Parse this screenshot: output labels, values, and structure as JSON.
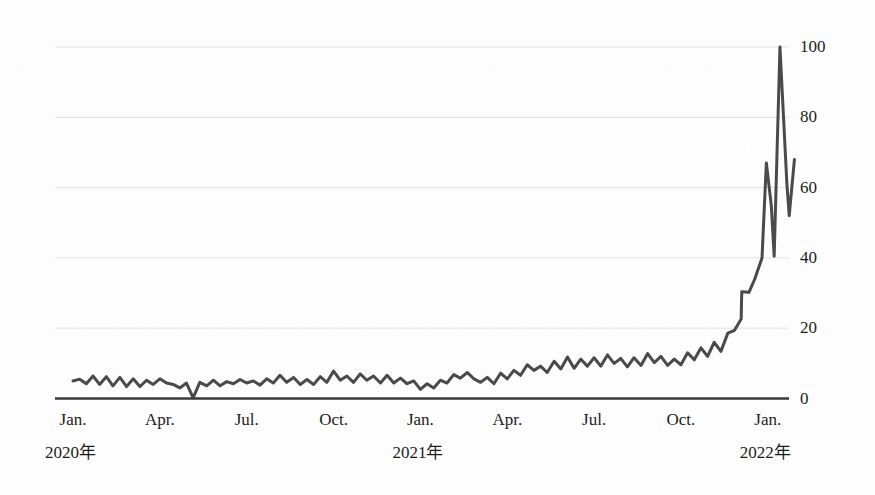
{
  "chart_data": {
    "type": "line",
    "title": "",
    "subtitle": "",
    "xlabel": "",
    "ylabel": "",
    "ylim": [
      0,
      108
    ],
    "yticks": [
      0,
      20,
      40,
      60,
      80,
      100
    ],
    "ytick_labels": [
      "0",
      "20",
      "40",
      "60",
      "80",
      "100"
    ],
    "grid": true,
    "grid_axis": "y",
    "legend": "none",
    "line_color": "#4a4a4a",
    "background_color": "#fdfdfd",
    "axis_color": "#3a3a3a",
    "grid_color": "#e2e2e2",
    "x_axis_type": "weekly-time-series",
    "x_start": "2020-01",
    "x_end": "2022-01",
    "xtick_labels": [
      {
        "label": "Jan.",
        "year": "2020年",
        "month_index": 0
      },
      {
        "label": "Apr.",
        "year": "",
        "month_index": 3
      },
      {
        "label": "Jul.",
        "year": "",
        "month_index": 6
      },
      {
        "label": "Oct.",
        "year": "",
        "month_index": 9
      },
      {
        "label": "Jan.",
        "year": "2021年",
        "month_index": 12
      },
      {
        "label": "Apr.",
        "year": "",
        "month_index": 15
      },
      {
        "label": "Jul.",
        "year": "",
        "month_index": 18
      },
      {
        "label": "Oct.",
        "year": "",
        "month_index": 21
      },
      {
        "label": "Jan.",
        "year": "2022年",
        "month_index": 24
      }
    ],
    "x": [
      0.0,
      0.23,
      0.46,
      0.69,
      0.92,
      1.15,
      1.38,
      1.62,
      1.85,
      2.08,
      2.31,
      2.54,
      2.77,
      3.0,
      3.23,
      3.46,
      3.69,
      3.92,
      4.15,
      4.38,
      4.62,
      4.85,
      5.08,
      5.31,
      5.54,
      5.77,
      6.0,
      6.23,
      6.46,
      6.69,
      6.92,
      7.15,
      7.38,
      7.62,
      7.85,
      8.08,
      8.31,
      8.54,
      8.77,
      9.0,
      9.23,
      9.46,
      9.69,
      9.92,
      10.15,
      10.38,
      10.62,
      10.85,
      11.08,
      11.31,
      11.54,
      11.77,
      12.0,
      12.23,
      12.46,
      12.69,
      12.92,
      13.15,
      13.38,
      13.62,
      13.85,
      14.08,
      14.31,
      14.54,
      14.77,
      15.0,
      15.23,
      15.46,
      15.69,
      15.92,
      16.15,
      16.38,
      16.62,
      16.85,
      17.08,
      17.31,
      17.54,
      17.77,
      18.0,
      18.23,
      18.46,
      18.69,
      18.92,
      19.15,
      19.38,
      19.62,
      19.85,
      20.08,
      20.31,
      20.54,
      20.77,
      21.0,
      21.23,
      21.46,
      21.69,
      21.92,
      22.15,
      22.38,
      22.62,
      22.85,
      23.08,
      23.31,
      23.54,
      23.77,
      24.0,
      24.23,
      24.46,
      24.69
    ],
    "values": [
      5.0,
      5.5,
      4.2,
      6.4,
      4.0,
      6.2,
      3.6,
      6.0,
      3.4,
      5.6,
      3.4,
      5.2,
      4.0,
      5.6,
      4.4,
      4.0,
      3.0,
      4.4,
      0.2,
      4.6,
      3.6,
      5.2,
      3.6,
      4.8,
      4.2,
      5.4,
      4.4,
      5.0,
      3.8,
      5.6,
      4.4,
      6.6,
      4.6,
      6.0,
      4.0,
      5.4,
      4.0,
      6.2,
      4.6,
      7.8,
      5.2,
      6.4,
      4.6,
      7.0,
      5.2,
      6.4,
      4.4,
      6.6,
      4.4,
      5.8,
      4.2,
      5.0,
      2.6,
      4.2,
      3.0,
      5.2,
      4.4,
      6.8,
      5.8,
      7.4,
      5.6,
      4.6,
      6.0,
      4.2,
      7.2,
      5.6,
      8.0,
      6.6,
      9.6,
      8.0,
      9.2,
      7.4,
      10.6,
      8.4,
      11.8,
      8.6,
      11.2,
      9.2,
      11.6,
      9.2,
      12.4,
      10.0,
      11.4,
      9.0,
      11.6,
      9.4,
      12.8,
      10.2,
      12.0,
      9.4,
      11.2,
      9.6,
      13.0,
      11.0,
      14.4,
      12.0,
      16.0,
      13.4,
      18.6,
      19.4,
      22.6,
      28.0,
      30.4,
      30.2,
      34.0,
      40.0,
      50.0,
      67.0
    ],
    "detail_tail": {
      "description": "sharp terminal spike",
      "points": [
        {
          "x": 23.1,
          "value": 30.4
        },
        {
          "x": 23.35,
          "value": 30.2
        },
        {
          "x": 23.55,
          "value": 34.0
        },
        {
          "x": 23.8,
          "value": 40.0
        },
        {
          "x": 23.95,
          "value": 67.0
        },
        {
          "x": 24.12,
          "value": 55.0
        },
        {
          "x": 24.22,
          "value": 40.5
        },
        {
          "x": 24.42,
          "value": 100.0
        },
        {
          "x": 24.66,
          "value": 61.0
        },
        {
          "x": 24.74,
          "value": 52.0
        },
        {
          "x": 24.92,
          "value": 68.0
        }
      ]
    }
  }
}
